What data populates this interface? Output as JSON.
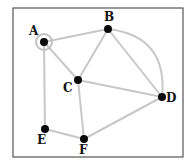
{
  "diagram": {
    "type": "graph",
    "colors": {
      "edge": "#c8c8c8",
      "node": "#0a0a0a",
      "ring": "#c0c0c0",
      "frame": "#555555",
      "label": "#111111"
    },
    "nodes": [
      {
        "id": "A",
        "label": "A",
        "highlighted": true
      },
      {
        "id": "B",
        "label": "B"
      },
      {
        "id": "C",
        "label": "C"
      },
      {
        "id": "D",
        "label": "D"
      },
      {
        "id": "E",
        "label": "E"
      },
      {
        "id": "F",
        "label": "F"
      }
    ],
    "edges": [
      {
        "from": "A",
        "to": "B",
        "shape": "straight"
      },
      {
        "from": "A",
        "to": "C",
        "shape": "straight"
      },
      {
        "from": "A",
        "to": "E",
        "shape": "straight"
      },
      {
        "from": "B",
        "to": "C",
        "shape": "straight"
      },
      {
        "from": "B",
        "to": "D",
        "shape": "straight"
      },
      {
        "from": "B",
        "to": "D",
        "shape": "arc"
      },
      {
        "from": "C",
        "to": "D",
        "shape": "straight"
      },
      {
        "from": "C",
        "to": "F",
        "shape": "straight"
      },
      {
        "from": "E",
        "to": "F",
        "shape": "straight"
      },
      {
        "from": "F",
        "to": "D",
        "shape": "straight"
      }
    ]
  }
}
